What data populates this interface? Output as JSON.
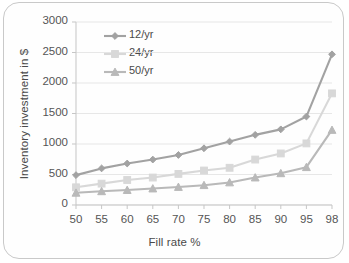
{
  "chart_data": {
    "type": "line",
    "title": "",
    "xlabel": "Fill rate %",
    "ylabel": "Inventory investment in $",
    "categories": [
      "50",
      "55",
      "60",
      "65",
      "70",
      "75",
      "80",
      "85",
      "90",
      "95",
      "98"
    ],
    "ylim": [
      0,
      3000
    ],
    "yticks": [
      "0",
      "500",
      "1000",
      "1500",
      "2000",
      "2500",
      "3000"
    ],
    "grid": true,
    "legend_position": "upper-left",
    "series": [
      {
        "name": "12/yr",
        "marker": "diamond",
        "color": "#8c8c8c",
        "values": [
          490,
          600,
          680,
          745,
          820,
          930,
          1040,
          1150,
          1240,
          1450,
          2470
        ]
      },
      {
        "name": "24/yr",
        "marker": "square",
        "color": "#cfcfcf",
        "values": [
          290,
          350,
          410,
          450,
          510,
          565,
          610,
          745,
          845,
          1010,
          1830
        ]
      },
      {
        "name": "50/yr",
        "marker": "triangle",
        "color": "#a8a8a8",
        "values": [
          200,
          225,
          245,
          270,
          295,
          325,
          370,
          450,
          520,
          620,
          1230
        ]
      }
    ]
  },
  "legend": {
    "items": [
      {
        "label": "12/yr"
      },
      {
        "label": "24/yr"
      },
      {
        "label": "50/yr"
      }
    ]
  }
}
